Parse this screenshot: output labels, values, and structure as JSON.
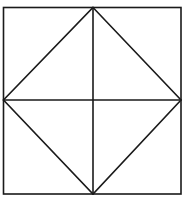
{
  "diagram": {
    "type": "geometric-figure",
    "stroke_color": "#1a1a1a",
    "background": "#ffffff",
    "square": {
      "x1": 3,
      "y1": 7,
      "x2": 181,
      "y2": 194
    },
    "center": {
      "x": 93,
      "y": 100
    },
    "midpoints": {
      "top": {
        "x": 93,
        "y": 7
      },
      "bottom": {
        "x": 93,
        "y": 194
      },
      "left": {
        "x": 3,
        "y": 100
      },
      "right": {
        "x": 181,
        "y": 100
      }
    }
  },
  "caption": {
    "text": ""
  }
}
